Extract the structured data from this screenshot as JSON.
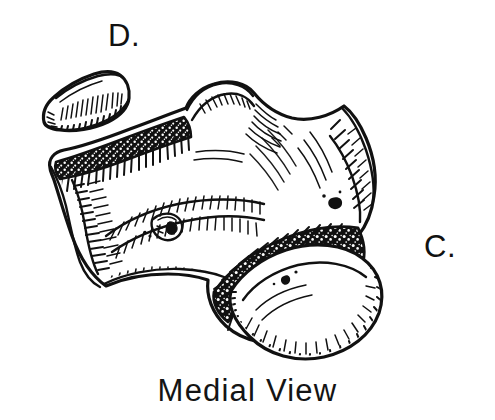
{
  "figure": {
    "caption": "Medial View",
    "background_color": "#ffffff",
    "ink_color": "#111111",
    "width": 495,
    "height": 420,
    "technique": "pen-and-ink stipple and hatch illustration"
  },
  "labels": [
    {
      "id": "d",
      "text": "D.",
      "x": 108,
      "y": 20
    },
    {
      "id": "c",
      "text": "C.",
      "x": 424,
      "y": 231
    }
  ],
  "illustration": {
    "parts": [
      {
        "name": "detached-bone-fragment",
        "position": "upper-left"
      },
      {
        "name": "main-bone-body",
        "position": "center"
      },
      {
        "name": "anterior-flange",
        "position": "left"
      },
      {
        "name": "superior-process",
        "position": "top-center"
      },
      {
        "name": "posterior-process",
        "position": "right"
      },
      {
        "name": "articular-condyle",
        "position": "lower-right"
      },
      {
        "name": "stippled-band-upper",
        "position": "upper-left-diagonal"
      },
      {
        "name": "stippled-band-lower",
        "position": "center-right-diagonal"
      },
      {
        "name": "nutrient-foramen",
        "position": "center-left"
      }
    ]
  }
}
